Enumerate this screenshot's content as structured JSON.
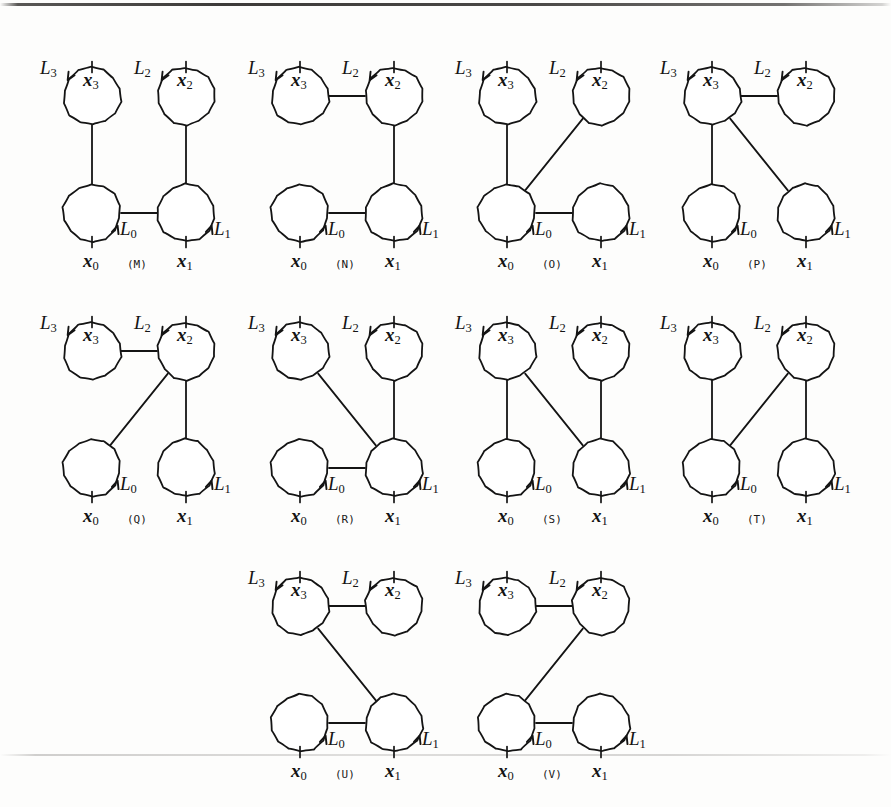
{
  "figure": {
    "kind": "graph-diagram-grid",
    "background_color": "#fdfdfc",
    "stroke_color": "#141414",
    "node_labels": [
      "x0",
      "x1",
      "x2",
      "x3"
    ],
    "edge_labels": [
      "L0",
      "L1",
      "L2",
      "L3"
    ],
    "node_label_text": {
      "x0": "x",
      "x0_sub": "0",
      "x1": "x",
      "x1_sub": "1",
      "x2": "x",
      "x2_sub": "2",
      "x3": "x",
      "x3_sub": "3"
    },
    "edge_label_text": {
      "L0": "L",
      "L0_sub": "0",
      "L1": "L",
      "L1_sub": "1",
      "L2": "L",
      "L2_sub": "2",
      "L3": "L",
      "L3_sub": "3"
    },
    "geometry": {
      "circle_radius": 29,
      "col_gap": 94,
      "row_gap": 117
    },
    "rows": [
      {
        "y": 36,
        "panels": [
          "M",
          "N",
          "O",
          "P"
        ],
        "x_positions": [
          40,
          248,
          455,
          660
        ]
      },
      {
        "y": 291,
        "panels": [
          "Q",
          "R",
          "S",
          "T"
        ],
        "x_positions": [
          40,
          248,
          455,
          660
        ]
      },
      {
        "y": 546,
        "panels": [
          "U",
          "V"
        ],
        "x_positions": [
          248,
          455
        ]
      }
    ],
    "panels": [
      {
        "tag": "(M)",
        "id": "M",
        "edges": [
          "x3-x0-vertical-left",
          "x2-x1-vertical-right",
          "x0-x1-horizontal-bottom"
        ],
        "arrows": {
          "L3": "down-right into upper-left of x3 circle",
          "L2": "down-right into upper-left of x2 circle",
          "L0": "up-right at lower-right of x0 circle",
          "L1": "up-right at lower-right of x1 circle"
        }
      },
      {
        "tag": "(N)",
        "id": "N",
        "edges": [
          "x3-x2-horizontal-top",
          "x2-x1-vertical-right",
          "x0-x1-horizontal-bottom"
        ]
      },
      {
        "tag": "(O)",
        "id": "O",
        "edges": [
          "x3-x0-vertical-left",
          "x2-x0-diagonal",
          "x0-x1-horizontal-bottom"
        ]
      },
      {
        "tag": "(P)",
        "id": "P",
        "edges": [
          "x3-x2-horizontal-top",
          "x3-x0-vertical-left",
          "x3-x1-diagonal"
        ]
      },
      {
        "tag": "(Q)",
        "id": "Q",
        "edges": [
          "x3-x2-horizontal-top",
          "x2-x0-diagonal",
          "x2-x1-vertical-right"
        ]
      },
      {
        "tag": "(R)",
        "id": "R",
        "edges": [
          "x3-x1-diagonal",
          "x2-x1-vertical-right",
          "x0-x1-horizontal-bottom"
        ]
      },
      {
        "tag": "(S)",
        "id": "S",
        "edges": [
          "x3-x0-vertical-left",
          "x3-x1-diagonal",
          "x2-x1-vertical-right"
        ]
      },
      {
        "tag": "(T)",
        "id": "T",
        "edges": [
          "x3-x0-vertical-left",
          "x2-x0-diagonal",
          "x2-x1-vertical-right"
        ]
      },
      {
        "tag": "(U)",
        "id": "U",
        "edges": [
          "x3-x2-horizontal-top",
          "x3-x1-diagonal",
          "x0-x1-horizontal-bottom"
        ]
      },
      {
        "tag": "(V)",
        "id": "V",
        "edges": [
          "x3-x2-horizontal-top",
          "x2-x0-diagonal",
          "x0-x1-horizontal-bottom"
        ]
      }
    ]
  }
}
